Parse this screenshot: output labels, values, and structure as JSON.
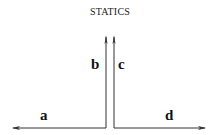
{
  "title": "STATICS",
  "labels": {
    "a": "a",
    "b": "b",
    "c": "c",
    "d": "d"
  },
  "colors": {
    "stroke": "#333333",
    "text": "#111111"
  }
}
